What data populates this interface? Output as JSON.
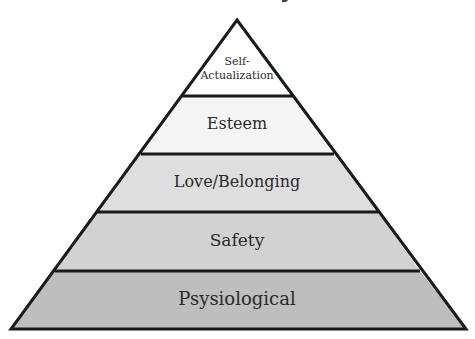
{
  "diagram": {
    "type": "pyramid",
    "levels": [
      {
        "label_line1": "Self-",
        "label_line2": "Actualization",
        "fill": "#ffffff"
      },
      {
        "label": "Esteem",
        "fill": "#f5f5f5"
      },
      {
        "label": "Love/Belonging",
        "fill": "#dedede"
      },
      {
        "label": "Safety",
        "fill": "#d2d2d2"
      },
      {
        "label": "Psysiological",
        "fill": "#bebebe"
      }
    ],
    "stroke": "#1a1a1a"
  }
}
